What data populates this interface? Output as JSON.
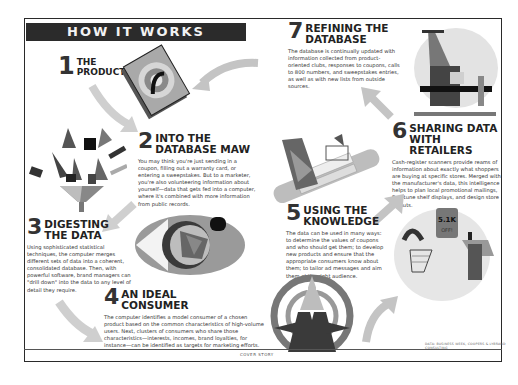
{
  "page": {
    "banner_title": "HOW IT WORKS",
    "footer_label": "COVER STORY",
    "credit_line": "DATA: BUSINESS WEEK, COOPERS & LYBRAND CONSULTING"
  },
  "steps": [
    {
      "number": "1",
      "title_line1": "THE",
      "title_line2": "PRODUCT",
      "body": ""
    },
    {
      "number": "2",
      "title_line1": "INTO THE",
      "title_line2": "DATABASE MAW",
      "body": "You may think you're just sending in a coupon, filling out a warranty card, or entering a sweepstakes. But to a marketer, you're also volunteering information about yourself—data that gets fed into a computer, where it's combined with more information from public records."
    },
    {
      "number": "3",
      "title_line1": "DIGESTING",
      "title_line2": "THE DATA",
      "body": "Using sophisticated statistical techniques, the computer merges different sets of data into a coherent, consolidated database. Then, with powerful software, brand managers can \"drill down\" into the data to any level of detail they require."
    },
    {
      "number": "4",
      "title_line1": "AN IDEAL",
      "title_line2": "CONSUMER",
      "body": "The computer identifies a model consumer of a chosen product based on the common characteristics of high-volume users. Next, clusters of consumers who share those characteristics—interests, incomes, brand loyalties, for instance—can be identified as targets for marketing efforts."
    },
    {
      "number": "5",
      "title_line1": "USING THE",
      "title_line2": "KNOWLEDGE",
      "body": "The data can be used in many ways: to determine the values of coupons and who should get them; to develop new products and ensure that the appropriate consumers know about them; to tailor ad messages and aim them at the right audience."
    },
    {
      "number": "6",
      "title_line1": "SHARING DATA",
      "title_line2": "WITH RETAILERS",
      "body": "Cash-register scanners provide reams of information about exactly what shoppers are buying at specific stores. Merged with the manufacturer's data, this intelligence helps to plan local promotional mailings, fine-tune shelf displays, and design store layouts."
    },
    {
      "number": "7",
      "title_line1": "REFINING THE",
      "title_line2": "DATABASE",
      "body": "The database is continually updated with information collected from product-oriented clubs, responses to coupons, calls to 800 numbers, and sweepstakes entries, as well as with new lists from outside sources."
    }
  ],
  "illustrations": {
    "product_box": "product-box-illustration",
    "funnel": "data-funnel-illustration",
    "eye": "eye-target-illustration",
    "handshake": "handshake-illustration",
    "target_person": "target-consumer-illustration",
    "store_sign": "5.1K OFF!",
    "cash_register": "cash-register-illustration"
  },
  "colors": {
    "banner_bg": "#2b2b2b",
    "banner_text": "#f2f2f2",
    "arrow_gray": "#c4c4c4",
    "frame": "#2a2a2a"
  }
}
